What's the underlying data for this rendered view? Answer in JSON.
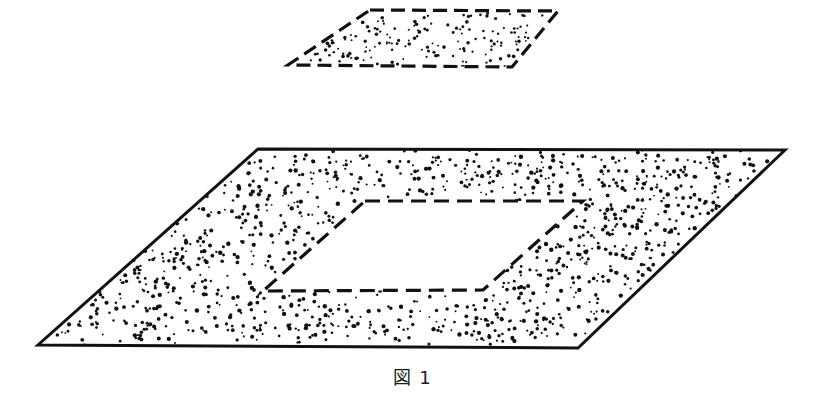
{
  "figure": {
    "caption": "図 1",
    "caption_label": "図",
    "caption_number": "1",
    "background_color": "#ffffff",
    "ink_color": "#111111",
    "stipple_color": "#111111"
  },
  "shapes": {
    "upper_plate": {
      "name": "upper-plate",
      "outline_style": "dashed",
      "fill": "stipple",
      "dash_pattern": "14 7",
      "stroke_width": 3.2,
      "points": [
        [
          370,
          10
        ],
        [
          558,
          11
        ],
        [
          512,
          67
        ],
        [
          288,
          65
        ]
      ],
      "stipple_seed": 7,
      "stipple_count": 150,
      "stipple_radius_min": 0.9,
      "stipple_radius_max": 1.9
    },
    "lower_plate": {
      "name": "lower-plate",
      "outline_style": "solid",
      "fill": "stipple",
      "stroke_width": 3.0,
      "points": [
        [
          258,
          149
        ],
        [
          785,
          150
        ],
        [
          578,
          348
        ],
        [
          38,
          345
        ]
      ],
      "stipple_seed": 19,
      "stipple_count": 1100,
      "stipple_radius_min": 0.9,
      "stipple_radius_max": 2.2
    },
    "lower_plate_hole": {
      "name": "lower-plate-hole",
      "outline_style": "dashed",
      "fill": "none",
      "dash_pattern": "15 8",
      "stroke_width": 3.2,
      "points": [
        [
          365,
          201
        ],
        [
          583,
          201
        ],
        [
          483,
          290
        ],
        [
          263,
          291
        ]
      ]
    }
  },
  "chart_data": {
    "type": "diagram",
    "title": "図 1",
    "elements": [
      {
        "id": "upper-plate",
        "label": "upper floating plate",
        "outline": "dashed",
        "fill": "stippled",
        "corners": [
          [
            370,
            10
          ],
          [
            558,
            11
          ],
          [
            512,
            67
          ],
          [
            288,
            65
          ]
        ]
      },
      {
        "id": "lower-plate",
        "label": "lower base plate",
        "outline": "solid",
        "fill": "stippled",
        "corners": [
          [
            258,
            149
          ],
          [
            785,
            150
          ],
          [
            578,
            348
          ],
          [
            38,
            345
          ]
        ]
      },
      {
        "id": "lower-plate-hole",
        "label": "opening in base plate",
        "outline": "dashed",
        "fill": "none",
        "corners": [
          [
            365,
            201
          ],
          [
            583,
            201
          ],
          [
            483,
            290
          ],
          [
            263,
            291
          ]
        ]
      }
    ]
  }
}
